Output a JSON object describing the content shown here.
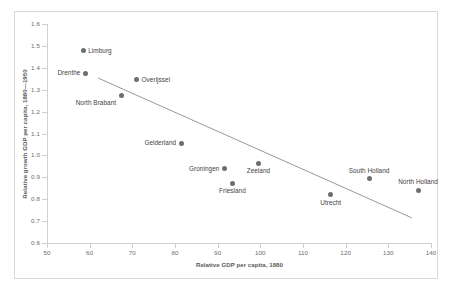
{
  "chart_data": {
    "type": "scatter",
    "title": "",
    "xlabel": "Relative GDP per capita, 1880",
    "ylabel": "Relative growth GDP per capita, 1880—1950",
    "xlim": [
      50,
      140
    ],
    "ylim": [
      0.6,
      1.6
    ],
    "xticks": [
      50,
      60,
      70,
      80,
      90,
      100,
      110,
      120,
      130,
      140
    ],
    "yticks": [
      "0.6",
      "0.7",
      "0.8",
      "0.9",
      "1.0",
      "1.1",
      "1.2",
      "1.3",
      "1.4",
      "1.5",
      "1.6"
    ],
    "grid": false,
    "legend": null,
    "marker_color": "#6e6e6e",
    "trendline_color": "#8c8c8c",
    "points": [
      {
        "label": "Limburg",
        "x": 58.5,
        "y": 1.477,
        "label_pos": "right"
      },
      {
        "label": "Drenthe",
        "x": 59.0,
        "y": 1.376,
        "label_pos": "left"
      },
      {
        "label": "Overijssel",
        "x": 71.0,
        "y": 1.345,
        "label_pos": "right"
      },
      {
        "label": "North Brabant",
        "x": 67.5,
        "y": 1.272,
        "label_pos": "below-left"
      },
      {
        "label": "Gelderland",
        "x": 81.5,
        "y": 1.055,
        "label_pos": "left"
      },
      {
        "label": "Groningen",
        "x": 91.5,
        "y": 0.94,
        "label_pos": "left"
      },
      {
        "label": "Zeeland",
        "x": 99.5,
        "y": 0.965,
        "label_pos": "below"
      },
      {
        "label": "Friesland",
        "x": 93.5,
        "y": 0.872,
        "label_pos": "below"
      },
      {
        "label": "Utrecht",
        "x": 116.5,
        "y": 0.82,
        "label_pos": "below"
      },
      {
        "label": "South Holland",
        "x": 125.5,
        "y": 0.893,
        "label_pos": "above"
      },
      {
        "label": "North Holland",
        "x": 137.0,
        "y": 0.84,
        "label_pos": "above"
      }
    ],
    "trendline": {
      "x_start": 62.0,
      "y_start": 1.353,
      "x_end": 135.5,
      "y_end": 0.715
    }
  }
}
